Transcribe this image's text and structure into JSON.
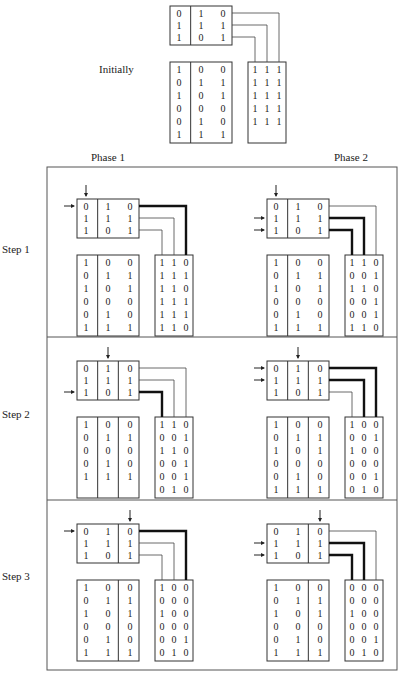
{
  "labels": {
    "initially": "Initially",
    "phase1": "Phase 1",
    "phase2": "Phase 2",
    "step1": "Step 1",
    "step2": "Step 2",
    "step3": "Step 3"
  },
  "initial": {
    "top_matrix": [
      [
        "0",
        "1",
        "0"
      ],
      [
        "1",
        "1",
        "1"
      ],
      [
        "1",
        "0",
        "1"
      ]
    ],
    "top_dividers": [
      1
    ],
    "left_matrix": [
      [
        "1",
        "0",
        "0"
      ],
      [
        "0",
        "1",
        "1"
      ],
      [
        "1",
        "0",
        "1"
      ],
      [
        "0",
        "0",
        "0"
      ],
      [
        "0",
        "1",
        "0"
      ],
      [
        "1",
        "1",
        "1"
      ]
    ],
    "left_dividers": [
      1
    ],
    "right_matrix": [
      [
        "1",
        "1",
        "1"
      ],
      [
        "1",
        "1",
        "1"
      ],
      [
        "1",
        "1",
        "1"
      ],
      [
        "1",
        "1",
        "1"
      ],
      [
        "1",
        "1",
        "1"
      ]
    ],
    "bold_wires": [],
    "row_arrows": [],
    "col_arrow": null
  },
  "panels": [
    {
      "step": "Step 1",
      "phase": "Phase 1",
      "top_matrix": [
        [
          "0",
          "1",
          "0"
        ],
        [
          "1",
          "1",
          "1"
        ],
        [
          "1",
          "0",
          "1"
        ]
      ],
      "top_dividers": [
        1
      ],
      "left_matrix": [
        [
          "1",
          "0",
          "0"
        ],
        [
          "0",
          "1",
          "1"
        ],
        [
          "1",
          "0",
          "1"
        ],
        [
          "0",
          "0",
          "0"
        ],
        [
          "0",
          "1",
          "0"
        ],
        [
          "1",
          "1",
          "1"
        ]
      ],
      "left_dividers": [
        1
      ],
      "right_matrix": [
        [
          "1",
          "1",
          "0"
        ],
        [
          "1",
          "1",
          "1"
        ],
        [
          "1",
          "1",
          "0"
        ],
        [
          "1",
          "1",
          "1"
        ],
        [
          "1",
          "1",
          "1"
        ],
        [
          "1",
          "1",
          "0"
        ]
      ],
      "bold_wires": [
        0
      ],
      "row_arrows": [
        0
      ],
      "col_arrow": 0
    },
    {
      "step": "Step 1",
      "phase": "Phase 2",
      "top_matrix": [
        [
          "0",
          "1",
          "0"
        ],
        [
          "1",
          "1",
          "1"
        ],
        [
          "1",
          "0",
          "1"
        ]
      ],
      "top_dividers": [
        1
      ],
      "left_matrix": [
        [
          "1",
          "0",
          "0"
        ],
        [
          "0",
          "1",
          "1"
        ],
        [
          "1",
          "0",
          "1"
        ],
        [
          "0",
          "0",
          "0"
        ],
        [
          "0",
          "1",
          "0"
        ],
        [
          "1",
          "1",
          "1"
        ]
      ],
      "left_dividers": [
        1
      ],
      "right_matrix": [
        [
          "1",
          "1",
          "0"
        ],
        [
          "0",
          "0",
          "1"
        ],
        [
          "1",
          "1",
          "0"
        ],
        [
          "0",
          "0",
          "1"
        ],
        [
          "0",
          "0",
          "1"
        ],
        [
          "1",
          "1",
          "0"
        ]
      ],
      "bold_wires": [
        1,
        2
      ],
      "row_arrows": [
        1,
        2
      ],
      "col_arrow": 0
    },
    {
      "step": "Step 2",
      "phase": "Phase 1",
      "top_matrix": [
        [
          "0",
          "1",
          "0"
        ],
        [
          "1",
          "1",
          "1"
        ],
        [
          "1",
          "0",
          "1"
        ]
      ],
      "top_dividers": [
        1,
        2
      ],
      "left_matrix": [
        [
          "1",
          "0",
          "0"
        ],
        [
          "0",
          "1",
          "1"
        ],
        [
          "0",
          "0",
          "0"
        ],
        [
          "0",
          "1",
          "0"
        ],
        [
          "1",
          "1",
          "1"
        ]
      ],
      "left_dividers": [
        1,
        2
      ],
      "right_matrix": [
        [
          "1",
          "1",
          "0"
        ],
        [
          "0",
          "0",
          "1"
        ],
        [
          "1",
          "1",
          "0"
        ],
        [
          "0",
          "0",
          "1"
        ],
        [
          "0",
          "0",
          "1"
        ],
        [
          "0",
          "1",
          "0"
        ]
      ],
      "bold_wires": [
        2
      ],
      "row_arrows": [
        2
      ],
      "col_arrow": 1
    },
    {
      "step": "Step 2",
      "phase": "Phase 2",
      "top_matrix": [
        [
          "0",
          "1",
          "0"
        ],
        [
          "1",
          "1",
          "1"
        ],
        [
          "1",
          "0",
          "1"
        ]
      ],
      "top_dividers": [
        1,
        2
      ],
      "left_matrix": [
        [
          "1",
          "0",
          "0"
        ],
        [
          "0",
          "1",
          "1"
        ],
        [
          "1",
          "0",
          "1"
        ],
        [
          "0",
          "0",
          "0"
        ],
        [
          "0",
          "1",
          "0"
        ],
        [
          "1",
          "1",
          "1"
        ]
      ],
      "left_dividers": [
        1,
        2
      ],
      "right_matrix": [
        [
          "1",
          "0",
          "0"
        ],
        [
          "0",
          "0",
          "1"
        ],
        [
          "1",
          "0",
          "0"
        ],
        [
          "0",
          "0",
          "0"
        ],
        [
          "0",
          "0",
          "1"
        ],
        [
          "0",
          "1",
          "0"
        ]
      ],
      "bold_wires": [
        0,
        1
      ],
      "row_arrows": [
        0,
        1
      ],
      "col_arrow": 1
    },
    {
      "step": "Step 3",
      "phase": "Phase 1",
      "top_matrix": [
        [
          "0",
          "1",
          "0"
        ],
        [
          "1",
          "1",
          "1"
        ],
        [
          "1",
          "0",
          "1"
        ]
      ],
      "top_dividers": [
        2
      ],
      "left_matrix": [
        [
          "1",
          "0",
          "0"
        ],
        [
          "0",
          "1",
          "1"
        ],
        [
          "1",
          "0",
          "1"
        ],
        [
          "0",
          "0",
          "0"
        ],
        [
          "0",
          "1",
          "0"
        ],
        [
          "1",
          "1",
          "1"
        ]
      ],
      "left_dividers": [
        2
      ],
      "right_matrix": [
        [
          "1",
          "0",
          "0"
        ],
        [
          "0",
          "0",
          "0"
        ],
        [
          "1",
          "0",
          "0"
        ],
        [
          "0",
          "0",
          "0"
        ],
        [
          "0",
          "0",
          "1"
        ],
        [
          "0",
          "1",
          "0"
        ]
      ],
      "bold_wires": [
        0
      ],
      "row_arrows": [
        0
      ],
      "col_arrow": 2
    },
    {
      "step": "Step 3",
      "phase": "Phase 2",
      "top_matrix": [
        [
          "0",
          "1",
          "0"
        ],
        [
          "1",
          "1",
          "1"
        ],
        [
          "1",
          "0",
          "1"
        ]
      ],
      "top_dividers": [
        2
      ],
      "left_matrix": [
        [
          "1",
          "0",
          "0"
        ],
        [
          "0",
          "1",
          "1"
        ],
        [
          "1",
          "0",
          "1"
        ],
        [
          "0",
          "0",
          "0"
        ],
        [
          "0",
          "1",
          "0"
        ],
        [
          "1",
          "1",
          "1"
        ]
      ],
      "left_dividers": [
        2
      ],
      "right_matrix": [
        [
          "0",
          "0",
          "0"
        ],
        [
          "0",
          "0",
          "0"
        ],
        [
          "1",
          "0",
          "0"
        ],
        [
          "0",
          "0",
          "0"
        ],
        [
          "0",
          "0",
          "1"
        ],
        [
          "0",
          "1",
          "0"
        ]
      ],
      "bold_wires": [
        1,
        2
      ],
      "row_arrows": [
        1,
        2
      ],
      "col_arrow": 2
    }
  ]
}
